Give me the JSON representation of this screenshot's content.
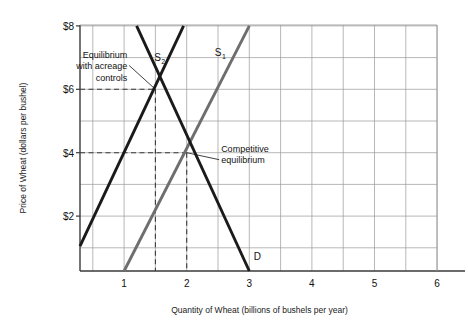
{
  "chart_data": {
    "type": "line",
    "title": "",
    "xlabel": "Quantity of Wheat (billions of bushels per year)",
    "ylabel": "Price of Wheat (dollars per bushel)",
    "xlim": [
      0,
      6
    ],
    "ylim": [
      0,
      8
    ],
    "xticks": [
      "1",
      "2",
      "3",
      "4",
      "5",
      "6"
    ],
    "xtick_values": [
      1,
      2,
      3,
      4,
      5,
      6
    ],
    "yticks": [
      "$2",
      "$4",
      "$6",
      "$8"
    ],
    "ytick_values": [
      2,
      4,
      6,
      8
    ],
    "grid": true,
    "grid_x_step": 0.5,
    "grid_y_step": 1,
    "legend": "none",
    "series": [
      {
        "name": "S1",
        "label": "S",
        "sub": "1",
        "role": "supply-competitive",
        "color": "#6e6e6e",
        "points": [
          [
            1.0,
            0.2
          ],
          [
            3.0,
            8.0
          ]
        ],
        "label_x": 2.45,
        "label_y": 7.05
      },
      {
        "name": "S2",
        "label": "S",
        "sub": "2",
        "role": "supply-acreage-controls",
        "color": "#1a1a1a",
        "points": [
          [
            0.2,
            1.05
          ],
          [
            1.95,
            8.0
          ]
        ],
        "label_x": 1.48,
        "label_y": 6.9
      },
      {
        "name": "D",
        "label": "D",
        "sub": "",
        "role": "demand",
        "color": "#1a1a1a",
        "points": [
          [
            1.2,
            8.0
          ],
          [
            3.0,
            0.2
          ]
        ],
        "label_x": 3.07,
        "label_y": 0.62
      }
    ],
    "points_of_interest": [
      {
        "name": "equilibrium-with-acreage-controls",
        "label": "Equilibrium\nwith acreage\ncontrols",
        "label_lines": [
          "Equilibrium",
          "with acreage",
          "controls"
        ],
        "x": 1.5,
        "y": 6,
        "guide_x": true,
        "guide_y": true,
        "leader_from_x": 1.05,
        "leader_from_y": 6.75
      },
      {
        "name": "competitive-equilibrium",
        "label": "Competitive\nequilibrium",
        "label_lines": [
          "Competitive",
          "equilibrium"
        ],
        "x": 2,
        "y": 4,
        "guide_x": true,
        "guide_y": true,
        "leader_from_x": 2.55,
        "leader_from_y": 3.78
      }
    ],
    "colors": {
      "axis": "#3a3a3a",
      "grid": "#9a9a9a",
      "dashed_guide": "#3a3a3a",
      "supply_competitive": "#6e6e6e",
      "supply_controls": "#1a1a1a",
      "demand": "#1a1a1a",
      "text": "#111111",
      "background": "#ffffff"
    }
  }
}
